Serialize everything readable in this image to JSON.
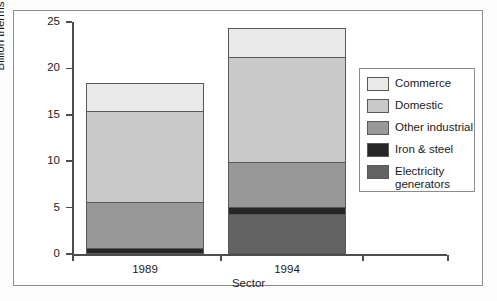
{
  "chart_data": {
    "type": "bar",
    "subtype": "stacked-vertical",
    "title": "",
    "xlabel": "Sector",
    "ylabel": "Billion therms",
    "categories": [
      "1989",
      "1994"
    ],
    "ylim": [
      0,
      25
    ],
    "yticks": [
      0,
      5,
      10,
      15,
      20,
      25
    ],
    "ytick_labels": [
      "0",
      "5",
      "10",
      "15",
      "20",
      "25"
    ],
    "grid": false,
    "legend_position": "right",
    "stack_order_bottom_to_top": [
      "Electricity generators",
      "Iron & steel",
      "Other industrial",
      "Domestic",
      "Commerce"
    ],
    "series": [
      {
        "name": "Commerce",
        "color": "#e9e9e9",
        "values": [
          3.0,
          3.1
        ]
      },
      {
        "name": "Domestic",
        "color": "#c9c9c9",
        "values": [
          9.8,
          11.3
        ]
      },
      {
        "name": "Other industrial",
        "color": "#989898",
        "values": [
          4.9,
          4.8
        ]
      },
      {
        "name": "Iron & steel",
        "color": "#262626",
        "values": [
          0.7,
          0.8
        ]
      },
      {
        "name": "Electricity generators",
        "color": "#636363",
        "values": [
          0.0,
          4.3
        ]
      }
    ],
    "totals": [
      18.4,
      24.3
    ]
  },
  "legend": {
    "entries": [
      {
        "label": "Commerce",
        "color": "#e9e9e9"
      },
      {
        "label": "Domestic",
        "color": "#c9c9c9"
      },
      {
        "label": "Other industrial",
        "color": "#989898"
      },
      {
        "label": "Iron & steel",
        "color": "#262626"
      },
      {
        "label": "Electricity\ngenerators",
        "color": "#636363"
      }
    ]
  },
  "axes": {
    "y_title": "Billion therms",
    "x_title": "Sector"
  }
}
